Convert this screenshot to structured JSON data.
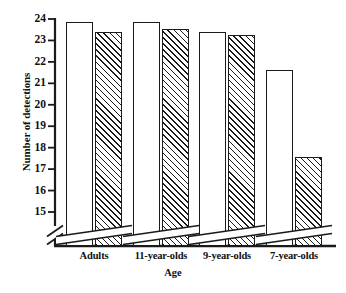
{
  "chart_data": {
    "type": "bar",
    "title": "",
    "xlabel": "Age",
    "ylabel": "Number of detections",
    "categories": [
      "Adults",
      "11-year-olds",
      "9-year-olds",
      "7-year-olds"
    ],
    "ylim": [
      14.5,
      24.2
    ],
    "yticks": [
      15,
      16,
      17,
      18,
      19,
      20,
      21,
      22,
      23,
      24
    ],
    "ytick_labels": [
      "15",
      "16",
      "17",
      "18",
      "19",
      "20",
      "21",
      "22",
      "23",
      "24"
    ],
    "grid": false,
    "legend": "none",
    "axis_break": true,
    "axis_break_note": "broken y-axis below 15; break slashes drawn across axis and across each bar",
    "series": [
      {
        "name": "open",
        "fill": "white",
        "values": [
          23.85,
          23.85,
          23.4,
          21.6
        ]
      },
      {
        "name": "hatched",
        "fill": "diagonal-hatch",
        "values": [
          23.4,
          23.55,
          23.25,
          17.55
        ]
      }
    ],
    "colors": {
      "ink": "#1a1a1a",
      "background": "#ffffff",
      "bar_open_fill": "#ffffff",
      "bar_hatch_line": "#1a1a1a"
    }
  }
}
